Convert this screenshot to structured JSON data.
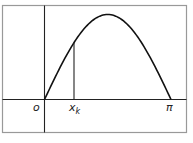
{
  "figure": {
    "function": "y = sin(x)",
    "x_range": [
      0,
      3.14159
    ],
    "labels": {
      "origin": "o",
      "xk_main": "x",
      "xk_sub": "k",
      "pi": "π"
    },
    "colors": {
      "curve": "#111111",
      "axes": "#222222",
      "frame": "#999999",
      "background": "#ffffff"
    }
  }
}
